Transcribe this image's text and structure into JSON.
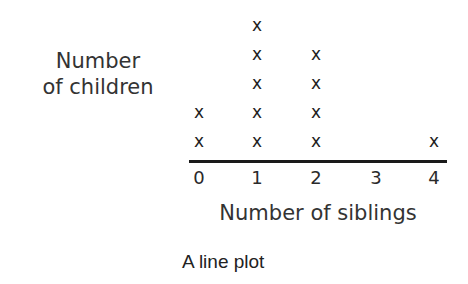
{
  "chart_data": {
    "type": "line-plot",
    "title": "",
    "caption": "A line plot",
    "xlabel": "Number of siblings",
    "ylabel": "Number of children",
    "ylabel_lines": [
      "Number",
      "of children"
    ],
    "categories": [
      "0",
      "1",
      "2",
      "3",
      "4"
    ],
    "values": [
      2,
      5,
      4,
      0,
      1
    ],
    "marker": "x",
    "xlim": [
      0,
      4
    ],
    "grid": false
  }
}
